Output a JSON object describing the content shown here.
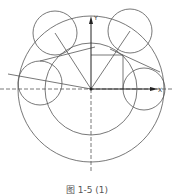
{
  "diagram": {
    "axes": {
      "x_label": "X",
      "y_label": "Y",
      "origin": [
        91,
        89
      ]
    },
    "outer_circle": {
      "cx": 91,
      "cy": 89,
      "r": 73
    },
    "inner_circle": {
      "cx": 91,
      "cy": 89,
      "r": 46
    },
    "small_circles": [
      {
        "cx": 55,
        "cy": 33,
        "r": 22
      },
      {
        "cx": 130,
        "cy": 31,
        "r": 22
      },
      {
        "cx": 40,
        "cy": 83,
        "r": 22
      },
      {
        "cx": 144,
        "cy": 89,
        "r": 21
      }
    ],
    "caption": "图 1-5 (1)",
    "stroke_color": "#555555"
  }
}
